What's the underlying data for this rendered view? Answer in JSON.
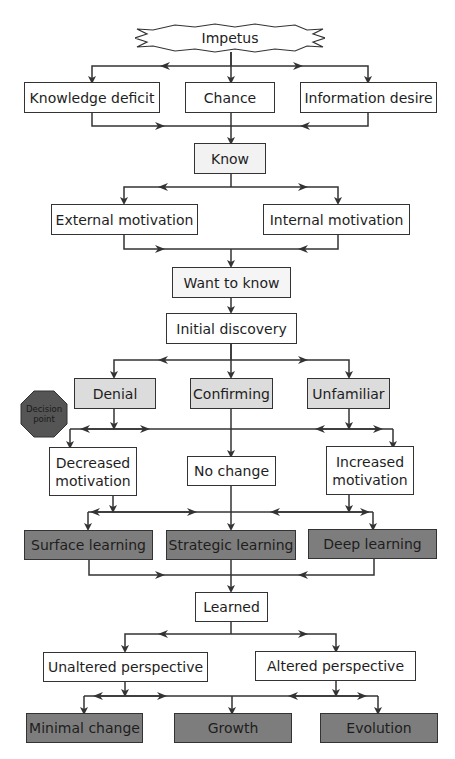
{
  "start": {
    "label": "Impetus",
    "shape": "starburst"
  },
  "sources": [
    {
      "label": "Knowledge deficit"
    },
    {
      "label": "Chance"
    },
    {
      "label": "Information desire"
    }
  ],
  "know": {
    "label": "Know"
  },
  "motivation_sources": [
    {
      "label": "External motivation"
    },
    {
      "label": "Internal motivation"
    }
  ],
  "want_to_know": {
    "label": "Want to know"
  },
  "initial_discovery": {
    "label": "Initial discovery"
  },
  "reactions": [
    {
      "label": "Denial"
    },
    {
      "label": "Confirming"
    },
    {
      "label": "Unfamiliar"
    }
  ],
  "decision_point": {
    "label": "Decision point",
    "line1": "Decision",
    "line2": "point"
  },
  "motivation_changes": [
    {
      "label": "Decreased motivation"
    },
    {
      "label": "No change"
    },
    {
      "label": "Increased motivation"
    }
  ],
  "learning_types": [
    {
      "label": "Surface learning"
    },
    {
      "label": "Strategic learning"
    },
    {
      "label": "Deep learning"
    }
  ],
  "learned": {
    "label": "Learned"
  },
  "perspectives": [
    {
      "label": "Unaltered perspective"
    },
    {
      "label": "Altered perspective"
    }
  ],
  "outcomes": [
    {
      "label": "Minimal change"
    },
    {
      "label": "Growth"
    },
    {
      "label": "Evolution"
    }
  ],
  "colors": {
    "line": "#333333",
    "box_white": "#ffffff",
    "box_light_gray": "#dcdcdc",
    "box_dark_gray": "#7d7d7d",
    "decision_octagon": "#555555"
  }
}
